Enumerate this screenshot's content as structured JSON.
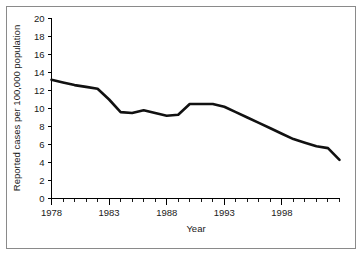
{
  "chart_data": {
    "type": "line",
    "title": "",
    "xlabel": "Year",
    "ylabel": "Reported cases per 100,000 population",
    "xlim": [
      1978,
      2003
    ],
    "ylim": [
      0,
      20
    ],
    "ytick_step": 2,
    "xtick_step": 1,
    "grid": false,
    "legend": false,
    "yticks": [
      "0",
      "2",
      "4",
      "6",
      "8",
      "10",
      "12",
      "14",
      "16",
      "18",
      "20"
    ],
    "ytick_values": [
      0,
      2,
      4,
      6,
      8,
      10,
      12,
      14,
      16,
      18,
      20
    ],
    "xticks": [
      "1978",
      "1983",
      "1988",
      "1993",
      "1998"
    ],
    "xtick_values": [
      1978,
      1983,
      1988,
      1993,
      1998
    ],
    "xminor_values": [
      1979,
      1980,
      1981,
      1982,
      1984,
      1985,
      1986,
      1987,
      1989,
      1990,
      1991,
      1992,
      1994,
      1995,
      1996,
      1997,
      1999,
      2000,
      2001,
      2002,
      2003
    ],
    "line_color": "#111111",
    "series": [
      {
        "name": "Reported cases per 100,000 population",
        "x": [
          1978,
          1979,
          1980,
          1981,
          1982,
          1983,
          1984,
          1985,
          1986,
          1987,
          1988,
          1989,
          1990,
          1991,
          1992,
          1993,
          1994,
          1995,
          1996,
          1997,
          1998,
          1999,
          2000,
          2001,
          2002,
          2003
        ],
        "values": [
          13.2,
          12.9,
          12.6,
          12.4,
          12.2,
          11.0,
          9.6,
          9.5,
          9.8,
          9.5,
          9.2,
          9.3,
          10.5,
          10.5,
          10.5,
          10.2,
          9.6,
          9.0,
          8.4,
          7.8,
          7.2,
          6.6,
          6.2,
          5.8,
          5.6,
          4.3
        ]
      }
    ]
  },
  "axes": {
    "x_axis_title": "Year",
    "y_axis_title": "Reported cases per 100,000 population"
  }
}
